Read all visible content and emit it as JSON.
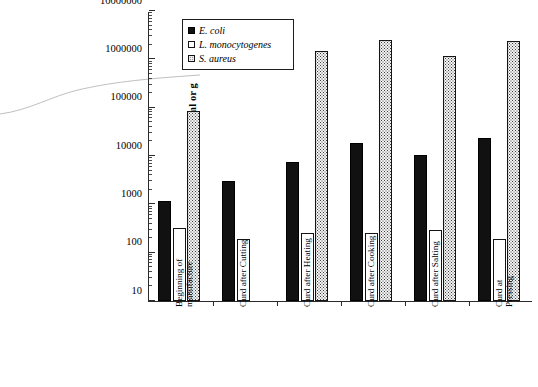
{
  "chart_data": {
    "type": "bar",
    "title": "",
    "xlabel": "",
    "ylabel": "Cfu/ml or g",
    "yscale": "log",
    "ylim": [
      10,
      10000000
    ],
    "ytick_labels": [
      "10",
      "100",
      "1000",
      "10000",
      "100000",
      "1000000",
      "10000000"
    ],
    "grid": false,
    "legend_position": "top-left-inside",
    "categories": [
      "Beginning of\nmanufacture",
      "Curd after Cutting",
      "Curd after Heating",
      "Curd after Cooking",
      "Curd after Salting",
      "Curd at Pressing"
    ],
    "series": [
      {
        "name": "E. coli",
        "fill": "solid-black",
        "values": [
          1200,
          3000,
          7500,
          19000,
          10500,
          24000
        ]
      },
      {
        "name": "L. monocytogenes",
        "fill": "open-white",
        "values": [
          320,
          190,
          260,
          255,
          290,
          195
        ]
      },
      {
        "name": "S. aureus",
        "fill": "dotted-stipple",
        "values": [
          85000,
          null,
          1500000,
          2500000,
          1150000,
          2350000
        ]
      }
    ]
  },
  "colors": {
    "axis": "#2b2b2b",
    "ecoli": "#111111",
    "lmono": "#ffffff",
    "saureus": "#f4f4f4",
    "background": "#ffffff"
  }
}
